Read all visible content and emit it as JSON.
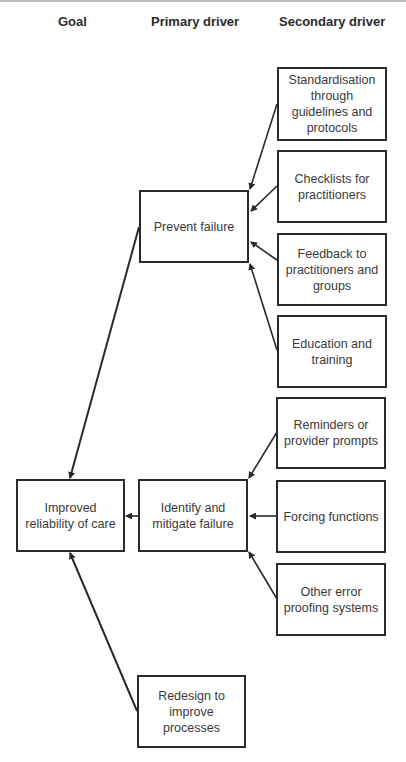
{
  "headers": {
    "goal": "Goal",
    "primary": "Primary driver",
    "secondary": "Secondary driver"
  },
  "goal": {
    "label": "Improved reliability of care"
  },
  "primary_drivers": [
    {
      "label": "Prevent failure"
    },
    {
      "label": "Identify and mitigate failure"
    },
    {
      "label": "Redesign to improve processes"
    }
  ],
  "secondary_drivers": [
    {
      "label": "Standardisation through guidelines and protocols",
      "feeds": "Prevent failure"
    },
    {
      "label": "Checklists for practitioners",
      "feeds": "Prevent failure"
    },
    {
      "label": "Feedback to practitioners and groups",
      "feeds": "Prevent failure"
    },
    {
      "label": "Education and training",
      "feeds": "Prevent failure"
    },
    {
      "label": "Reminders or provider prompts",
      "feeds": "Identify and mitigate failure"
    },
    {
      "label": "Forcing functions",
      "feeds": "Identify and mitigate failure"
    },
    {
      "label": "Other error proofing systems",
      "feeds": "Identify and mitigate failure"
    }
  ],
  "colors": {
    "line": "#2a2a2a",
    "text": "#3a3a3a",
    "background": "#ffffff"
  }
}
